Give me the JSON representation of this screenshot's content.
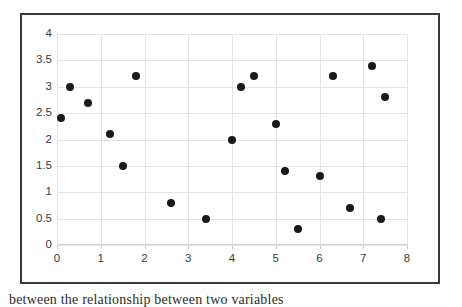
{
  "figure": {
    "border_color": "#3a3a3a",
    "background": "#ffffff"
  },
  "caption": {
    "text": "between the relationship between two variables"
  },
  "chart_data": {
    "type": "scatter",
    "title": "",
    "subtitle": "",
    "xlabel": "",
    "ylabel": "",
    "xlim": [
      0,
      8
    ],
    "ylim": [
      0,
      4
    ],
    "grid": true,
    "legend": false,
    "legend_position": "none",
    "marker": {
      "shape": "circle",
      "color": "#1a1a1a",
      "size_px": 8
    },
    "gridline_color": "#e4e4e4",
    "axis_color": "#bfbfbf",
    "tick_label_color": "#3b3b3b",
    "xticks": [
      0,
      1,
      2,
      3,
      4,
      5,
      6,
      7,
      8
    ],
    "xtick_labels": [
      "0",
      "1",
      "2",
      "3",
      "4",
      "5",
      "6",
      "7",
      "8"
    ],
    "yticks": [
      0,
      0.5,
      1,
      1.5,
      2,
      2.5,
      3,
      3.5,
      4
    ],
    "ytick_labels": [
      "0",
      "0.5",
      "1",
      "1.5",
      "2",
      "2.5",
      "3",
      "3.5",
      "4"
    ],
    "series": [
      {
        "name": "data",
        "points": [
          {
            "x": 0.1,
            "y": 2.4
          },
          {
            "x": 0.3,
            "y": 3.0
          },
          {
            "x": 0.7,
            "y": 2.7
          },
          {
            "x": 1.2,
            "y": 2.1
          },
          {
            "x": 1.5,
            "y": 1.5
          },
          {
            "x": 1.8,
            "y": 3.2
          },
          {
            "x": 2.6,
            "y": 0.8
          },
          {
            "x": 3.4,
            "y": 0.5
          },
          {
            "x": 4.0,
            "y": 2.0
          },
          {
            "x": 4.2,
            "y": 3.0
          },
          {
            "x": 4.5,
            "y": 3.2
          },
          {
            "x": 5.0,
            "y": 2.3
          },
          {
            "x": 5.2,
            "y": 1.4
          },
          {
            "x": 5.5,
            "y": 0.3
          },
          {
            "x": 6.0,
            "y": 1.3
          },
          {
            "x": 6.3,
            "y": 3.2
          },
          {
            "x": 6.7,
            "y": 0.7
          },
          {
            "x": 7.2,
            "y": 3.4
          },
          {
            "x": 7.4,
            "y": 0.5
          },
          {
            "x": 7.5,
            "y": 2.8
          }
        ]
      }
    ]
  }
}
